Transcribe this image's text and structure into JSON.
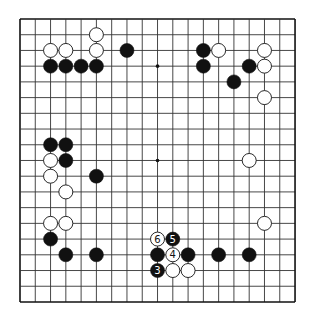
{
  "board": {
    "size": 19,
    "origin_x": 20,
    "origin_y": 19,
    "step_x": 15.28,
    "step_y": 15.72,
    "stone_radius": 7,
    "line_color": "#333333",
    "border_color": "#111111",
    "black_color": "#111111",
    "white_color": "#ffffff",
    "star_points": [
      [
        9,
        3
      ],
      [
        9,
        9
      ]
    ],
    "stones": [
      {
        "c": "w",
        "col": 5,
        "row": 1
      },
      {
        "c": "w",
        "col": 2,
        "row": 2
      },
      {
        "c": "w",
        "col": 3,
        "row": 2
      },
      {
        "c": "w",
        "col": 5,
        "row": 2
      },
      {
        "c": "b",
        "col": 7,
        "row": 2
      },
      {
        "c": "b",
        "col": 2,
        "row": 3
      },
      {
        "c": "b",
        "col": 3,
        "row": 3
      },
      {
        "c": "b",
        "col": 4,
        "row": 3
      },
      {
        "c": "b",
        "col": 5,
        "row": 3
      },
      {
        "c": "b",
        "col": 12,
        "row": 2
      },
      {
        "c": "w",
        "col": 13,
        "row": 2
      },
      {
        "c": "b",
        "col": 12,
        "row": 3
      },
      {
        "c": "w",
        "col": 16,
        "row": 2
      },
      {
        "c": "b",
        "col": 15,
        "row": 3
      },
      {
        "c": "w",
        "col": 16,
        "row": 3
      },
      {
        "c": "b",
        "col": 14,
        "row": 4
      },
      {
        "c": "w",
        "col": 16,
        "row": 5
      },
      {
        "c": "b",
        "col": 2,
        "row": 8
      },
      {
        "c": "b",
        "col": 3,
        "row": 8
      },
      {
        "c": "w",
        "col": 2,
        "row": 9
      },
      {
        "c": "b",
        "col": 3,
        "row": 9
      },
      {
        "c": "w",
        "col": 2,
        "row": 10
      },
      {
        "c": "b",
        "col": 5,
        "row": 10
      },
      {
        "c": "w",
        "col": 3,
        "row": 11
      },
      {
        "c": "w",
        "col": 15,
        "row": 9
      },
      {
        "c": "w",
        "col": 2,
        "row": 13
      },
      {
        "c": "w",
        "col": 3,
        "row": 13
      },
      {
        "c": "w",
        "col": 16,
        "row": 13
      },
      {
        "c": "b",
        "col": 2,
        "row": 14
      },
      {
        "c": "b",
        "col": 3,
        "row": 15
      },
      {
        "c": "b",
        "col": 5,
        "row": 15
      },
      {
        "c": "w",
        "col": 9,
        "row": 14,
        "label": "6"
      },
      {
        "c": "b",
        "col": 10,
        "row": 14,
        "label": "5"
      },
      {
        "c": "b",
        "col": 9,
        "row": 15
      },
      {
        "c": "w",
        "col": 10,
        "row": 15,
        "label": "4"
      },
      {
        "c": "b",
        "col": 11,
        "row": 15
      },
      {
        "c": "b",
        "col": 13,
        "row": 15
      },
      {
        "c": "b",
        "col": 15,
        "row": 15
      },
      {
        "c": "b",
        "col": 9,
        "row": 16,
        "label": "3"
      },
      {
        "c": "w",
        "col": 10,
        "row": 16
      },
      {
        "c": "w",
        "col": 11,
        "row": 16
      }
    ]
  }
}
